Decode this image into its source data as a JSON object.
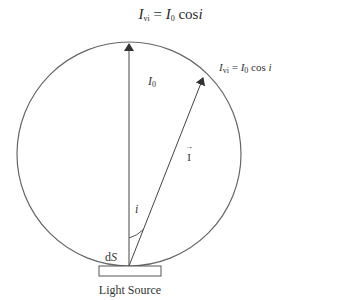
{
  "title": {
    "lhs_symbol": "I",
    "lhs_sub": "vi",
    "equals": "=",
    "rhs_symbol": "I",
    "rhs_sub": "0",
    "rhs_func": "cos",
    "rhs_var": "i"
  },
  "labels": {
    "i0_symbol": "I",
    "i0_sub": "0",
    "ivi_symbol": "I",
    "ivi_sub": "vi",
    "ivi_equals": "=",
    "ivi_rhs_symbol": "I",
    "ivi_rhs_sub": "0",
    "ivi_func": "cos",
    "ivi_var": "i",
    "vector_I": "I",
    "vector_arrow": "→",
    "angle": "i",
    "dS_d": "d",
    "dS_S": "S",
    "light_source": "Light Source"
  },
  "colors": {
    "stroke": "#555555",
    "text": "#333333",
    "background": "#ffffff"
  }
}
